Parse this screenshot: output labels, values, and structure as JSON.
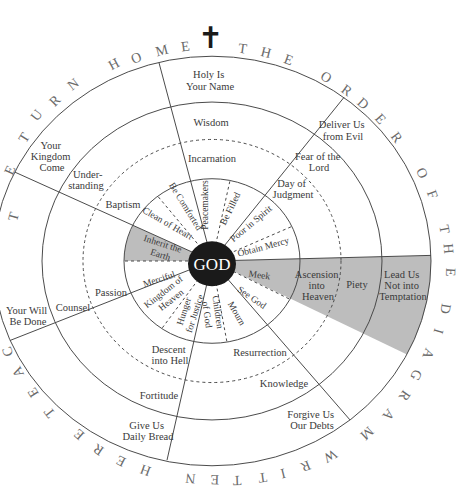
{
  "title_rim": {
    "text": "RETURN HOME THE ORDER OF THE DIAGRAM WRITTEN HERE TEACH",
    "segments": [
      {
        "text": "R E T U R N   H O M E"
      },
      {
        "text": "T H E   O R D E R   O F   T H E"
      },
      {
        "text": "D I A G R A M   W R I T T E N"
      },
      {
        "text": "H E R E   T E A C"
      }
    ]
  },
  "cross_icon": "✝",
  "center": {
    "label": "GOD",
    "color": "#1a1a1a"
  },
  "colors": {
    "shade": "#bdbdbd",
    "line": "#444444",
    "text": "#3a3a3a"
  },
  "petitions": {
    "holy": {
      "line1": "Holy Is",
      "line2": "Your Name"
    },
    "deliver": {
      "line1": "Deliver Us",
      "line2": "from Evil"
    },
    "lead": {
      "line1": "Lead Us",
      "line2": "Not into",
      "line3": "Temptation"
    },
    "forgive": {
      "line1": "Forgive Us",
      "line2": "Our Debts"
    },
    "bread": {
      "line1": "Give Us",
      "line2": "Daily Bread"
    },
    "will": {
      "line1": "Your Will",
      "line2": "Be Done"
    },
    "kingdom": {
      "line1": "Your",
      "line2": "Kingdom",
      "line3": "Come"
    }
  },
  "gifts": {
    "wisdom": "Wisdom",
    "fear": {
      "line1": "Fear of the",
      "line2": "Lord"
    },
    "piety": "Piety",
    "knowledge": "Knowledge",
    "fortitude": "Fortitude",
    "counsel": "Counsel",
    "understanding": {
      "line1": "Under-",
      "line2": "standing"
    }
  },
  "mysteries": {
    "incarnation": "Incarnation",
    "judgment": {
      "line1": "Day of",
      "line2": "Judgment"
    },
    "ascension": {
      "line1": "Ascension",
      "line2": "into",
      "line3": "Heaven"
    },
    "resurrection": "Resurrection",
    "descent": {
      "line1": "Descent",
      "line2": "into Hell"
    },
    "passion": "Passion",
    "baptism": "Baptism"
  },
  "beatitudes": {
    "peacemakers": "Peacemakers",
    "be_filled": "Be Filled",
    "poor_in_spirit": "Poor in Spirit",
    "obtain_mercy": "Obtain Mercy",
    "meek": "Meek",
    "see_god": "See God",
    "mourn": "Mourn",
    "children": {
      "line1": "Children",
      "line2": "of God"
    },
    "hunger": {
      "line1": "Hunger",
      "line2": "for Justice"
    },
    "kingdom_heaven": {
      "line1": "Kingdom of",
      "line2": "Heaven"
    },
    "merciful": "Merciful",
    "inherit": {
      "line1": "Inherit the",
      "line2": "Earth"
    },
    "clean": "Clean of Heart",
    "comforted": "Be Comforted"
  }
}
